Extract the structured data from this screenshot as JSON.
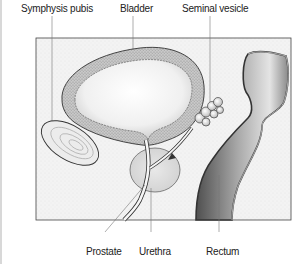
{
  "diagram": {
    "type": "anatomical-illustration",
    "labels_top": [
      {
        "id": "symphysis-pubis",
        "text": "Symphysis pubis"
      },
      {
        "id": "bladder",
        "text": "Bladder"
      },
      {
        "id": "seminal-vesicle",
        "text": "Seminal vesicle"
      }
    ],
    "labels_bottom": [
      {
        "id": "prostate",
        "text": "Prostate"
      },
      {
        "id": "urethra",
        "text": "Urethra"
      },
      {
        "id": "rectum",
        "text": "Rectum"
      }
    ],
    "colors": {
      "frame_fill": "#f4f4f4",
      "outline": "#333333",
      "bladder_wall": "#bdbdbd",
      "rectum_dark": "#6a6a6a",
      "leader_line": "#666666"
    }
  }
}
